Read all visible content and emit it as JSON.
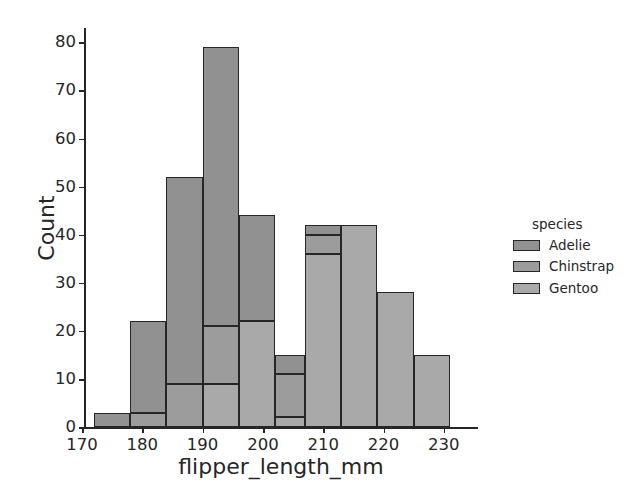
{
  "chart_data": {
    "type": "bar",
    "subtype": "stacked-histogram",
    "title": "",
    "xlabel": "flipper_length_mm",
    "ylabel": "Count",
    "xlim": [
      170.5,
      235.5
    ],
    "ylim": [
      0,
      83
    ],
    "xticks": [
      170,
      180,
      190,
      200,
      210,
      220,
      230
    ],
    "yticks": [
      0,
      10,
      20,
      30,
      40,
      50,
      60,
      70,
      80
    ],
    "grid": false,
    "legend": {
      "title": "species",
      "position": "right-outside",
      "entries": [
        "Adelie",
        "Chinstrap",
        "Gentoo"
      ]
    },
    "bin_edges": [
      172,
      178,
      184,
      190,
      196,
      202,
      207,
      213,
      219,
      225,
      231
    ],
    "bins": [
      {
        "x0": 172,
        "x1": 178,
        "Adelie": 3,
        "Chinstrap": 0,
        "Gentoo": 0,
        "total": 3
      },
      {
        "x0": 178,
        "x1": 184,
        "Adelie": 19,
        "Chinstrap": 3,
        "Gentoo": 0,
        "total": 22
      },
      {
        "x0": 184,
        "x1": 190,
        "Adelie": 43,
        "Chinstrap": 9,
        "Gentoo": 0,
        "total": 52
      },
      {
        "x0": 190,
        "x1": 196,
        "Adelie": 58,
        "Chinstrap": 12,
        "Gentoo": 9,
        "total": 79
      },
      {
        "x0": 196,
        "x1": 202,
        "Adelie": 22,
        "Chinstrap": 0,
        "Gentoo": 22,
        "total": 44
      },
      {
        "x0": 202,
        "x1": 207,
        "Adelie": 4,
        "Chinstrap": 9,
        "Gentoo": 2,
        "total": 15
      },
      {
        "x0": 207,
        "x1": 213,
        "Adelie": 2,
        "Chinstrap": 4,
        "Gentoo": 36,
        "total": 42
      },
      {
        "x0": 213,
        "x1": 219,
        "Adelie": 0,
        "Chinstrap": 0,
        "Gentoo": 42,
        "total": 42
      },
      {
        "x0": 219,
        "x1": 225,
        "Adelie": 0,
        "Chinstrap": 0,
        "Gentoo": 28,
        "total": 28
      },
      {
        "x0": 225,
        "x1": 231,
        "Adelie": 0,
        "Chinstrap": 0,
        "Gentoo": 15,
        "total": 15
      }
    ],
    "series": [
      {
        "name": "Adelie",
        "color": "#919191",
        "values": [
          3,
          19,
          43,
          58,
          22,
          4,
          2,
          0,
          0,
          0
        ]
      },
      {
        "name": "Chinstrap",
        "color": "#9c9c9c",
        "values": [
          0,
          3,
          9,
          12,
          0,
          9,
          4,
          0,
          0,
          0
        ]
      },
      {
        "name": "Gentoo",
        "color": "#a9a9a9",
        "values": [
          0,
          0,
          0,
          9,
          22,
          2,
          36,
          42,
          28,
          15
        ]
      }
    ],
    "colors": {
      "Adelie": "#919191",
      "Chinstrap": "#9c9c9c",
      "Gentoo": "#a9a9a9",
      "edge": "#262626",
      "text": "#262626",
      "background": "#ffffff"
    }
  }
}
